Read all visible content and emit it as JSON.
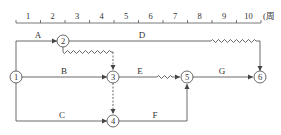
{
  "timescale": {
    "unit_label": "(周",
    "ticks": [
      "1",
      "2",
      "3",
      "4",
      "5",
      "6",
      "7",
      "8",
      "9",
      "10"
    ]
  },
  "nodes": [
    {
      "id": "1",
      "label": "1"
    },
    {
      "id": "2",
      "label": "2"
    },
    {
      "id": "3",
      "label": "3"
    },
    {
      "id": "4",
      "label": "4"
    },
    {
      "id": "5",
      "label": "5"
    },
    {
      "id": "6",
      "label": "6"
    }
  ],
  "activities": [
    {
      "name": "A",
      "from": "1",
      "to": "2"
    },
    {
      "name": "B",
      "from": "1",
      "to": "3"
    },
    {
      "name": "C",
      "from": "1",
      "to": "4"
    },
    {
      "name": "D",
      "from": "2",
      "to": "6"
    },
    {
      "name": "E",
      "from": "3",
      "to": "5"
    },
    {
      "name": "F",
      "from": "4",
      "to": "5"
    },
    {
      "name": "G",
      "from": "5",
      "to": "6"
    }
  ],
  "dummy_activities": [
    {
      "from": "2",
      "to": "3"
    },
    {
      "from": "3",
      "to": "4"
    }
  ],
  "colors": {
    "line": "#444444",
    "text": "#333333"
  }
}
